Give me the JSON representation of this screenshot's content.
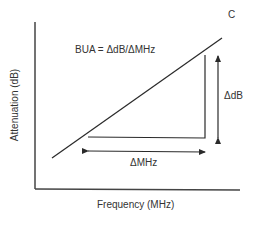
{
  "diagram": {
    "curve_label": "C",
    "formula": "BUA = ΔdB/ΔMHz",
    "delta_db_label": "ΔdB",
    "delta_mhz_label": "ΔMHz",
    "x_axis_label": "Frequency (MHz)",
    "y_axis_label": "Attenuation (dB)",
    "line_color": "#2a2a2a"
  }
}
